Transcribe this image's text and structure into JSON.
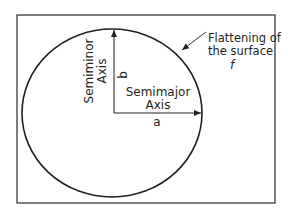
{
  "diagram": {
    "type": "ellipse-axes",
    "colors": {
      "stroke": "#231f20",
      "frame": "#3a3a3a",
      "background": "#ffffff"
    },
    "labels": {
      "semiminor_line1": "Semiminor",
      "semiminor_line2": "Axis",
      "b": "b",
      "semimajor_line1": "Semimajor",
      "semimajor_line2": "Axis",
      "a": "a",
      "flattening_line1": "Flattening of",
      "flattening_line2": "the surface",
      "f": "f"
    }
  }
}
